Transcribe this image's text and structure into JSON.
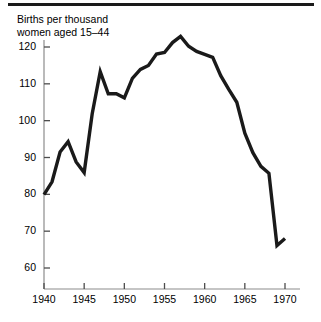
{
  "figure": {
    "name": "us-birth-rate-line-chart",
    "top_rule_color": "#1a1a1a",
    "line_color": "#1a1a1a",
    "axis_color": "#8c8c8c",
    "background": "#ffffff"
  },
  "chart_data": {
    "type": "line",
    "title_line1": "Births per thousand",
    "title_line2": "women aged 15–44",
    "xlabel": "",
    "ylabel": "",
    "grid": false,
    "legend": "none",
    "xlim": [
      1940,
      1971
    ],
    "ylim": [
      58,
      124
    ],
    "xticks": [
      1940,
      1945,
      1950,
      1955,
      1960,
      1965,
      1970
    ],
    "xtick_labels": [
      "1940",
      "1945",
      "1950",
      "1955",
      "1960",
      "1965",
      "1970"
    ],
    "yticks": [
      60,
      70,
      80,
      90,
      100,
      110,
      120
    ],
    "ytick_labels": [
      "60",
      "70",
      "80",
      "90",
      "100",
      "110",
      "120"
    ],
    "series": [
      {
        "name": "Births per thousand women aged 15-44",
        "x": [
          1940,
          1941,
          1942,
          1943,
          1944,
          1945,
          1946,
          1947,
          1948,
          1949,
          1950,
          1951,
          1952,
          1953,
          1954,
          1955,
          1956,
          1957,
          1958,
          1959,
          1960,
          1961,
          1962,
          1963,
          1964,
          1965,
          1966,
          1967,
          1968,
          1969,
          1970
        ],
        "y": [
          79.9,
          83.4,
          91.5,
          94.3,
          88.8,
          85.9,
          101.9,
          113.3,
          107.3,
          107.3,
          106.2,
          111.5,
          113.9,
          115.0,
          118.1,
          118.5,
          121.2,
          122.9,
          120.2,
          118.8,
          118.0,
          117.2,
          112.2,
          108.5,
          105.0,
          96.6,
          91.3,
          87.6,
          85.7,
          66.1,
          68.0
        ]
      }
    ]
  },
  "bottom_cut_text": {
    "value": " "
  }
}
